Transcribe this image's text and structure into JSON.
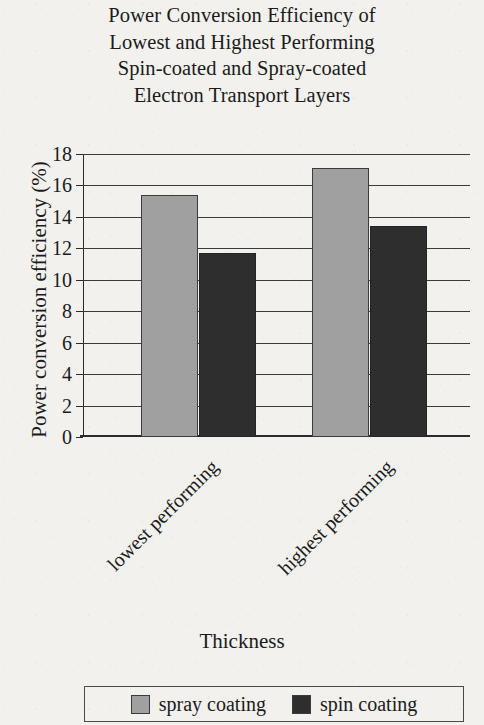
{
  "chart_data": {
    "type": "bar",
    "title": "Power Conversion Efficiency of Lowest and Highest Performing Spin-coated and Spray-coated Electron Transport Layers",
    "title_lines": [
      "Power Conversion Efficiency of",
      "Lowest and Highest Performing",
      "Spin-coated and Spray-coated",
      "Electron Transport Layers"
    ],
    "xlabel": "Thickness",
    "ylabel": "Power conversion efficiency (%)",
    "categories": [
      "lowest performing",
      "highest performing"
    ],
    "series": [
      {
        "name": "spray coating",
        "color": "#a0a0a0",
        "values": [
          15.4,
          17.1
        ]
      },
      {
        "name": "spin coating",
        "color": "#2e2e2e",
        "values": [
          11.7,
          13.4
        ]
      }
    ],
    "ylim": [
      0,
      18
    ],
    "ytick_step": 2,
    "ytick_labels": [
      "18",
      "16",
      "14",
      "12",
      "10",
      "8",
      "6",
      "4",
      "2",
      "0"
    ],
    "ytick_values": [
      18,
      16,
      14,
      12,
      10,
      8,
      6,
      4,
      2,
      0
    ],
    "grid": true,
    "grid_axis": "y",
    "legend_position": "bottom",
    "xtick_rotation": -45
  },
  "legend": {
    "items": [
      {
        "label": "spray coating",
        "color": "#a0a0a0"
      },
      {
        "label": "spin coating",
        "color": "#2e2e2e"
      }
    ]
  }
}
